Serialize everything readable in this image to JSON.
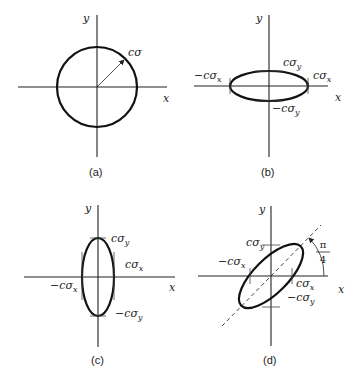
{
  "panels": [
    {
      "id": "a",
      "caption": "(a)",
      "axis_x": "x",
      "axis_y": "y",
      "shape": "circle",
      "radius_label": "cσ"
    },
    {
      "id": "b",
      "caption": "(b)",
      "axis_x": "x",
      "axis_y": "y",
      "shape": "horizontal ellipse",
      "labels": {
        "pos_y": "cσy",
        "neg_x": "−cσx",
        "pos_x": "cσx",
        "neg_y": "−cσy"
      },
      "parts": {
        "c": "c",
        "sigma": "σ",
        "x": "x",
        "y": "y",
        "minus": "−"
      }
    },
    {
      "id": "c",
      "caption": "(c)",
      "axis_x": "x",
      "axis_y": "y",
      "shape": "vertical ellipse",
      "labels": {
        "pos_y": "cσy",
        "pos_x": "cσx",
        "neg_x": "−cσx",
        "neg_y": "−cσy"
      }
    },
    {
      "id": "d",
      "caption": "(d)",
      "axis_x": "x",
      "axis_y": "y",
      "shape": "ellipse rotated by π/4",
      "labels": {
        "pos_y": "cσy",
        "neg_x": "−cσx",
        "pos_x": "cσx",
        "neg_y": "−cσy"
      },
      "angle": {
        "numerator": "π",
        "denominator": "4"
      }
    }
  ],
  "text": {
    "x": "x",
    "y": "y",
    "c_sigma": "cσ",
    "c_sigma_prefix": "cσ",
    "neg_c_sigma_prefix": "−cσ",
    "sub_x": "x",
    "sub_y": "y",
    "cap_a": "(a)",
    "cap_b": "(b)",
    "cap_c": "(c)",
    "cap_d": "(d)",
    "pi": "π",
    "four": "4"
  }
}
